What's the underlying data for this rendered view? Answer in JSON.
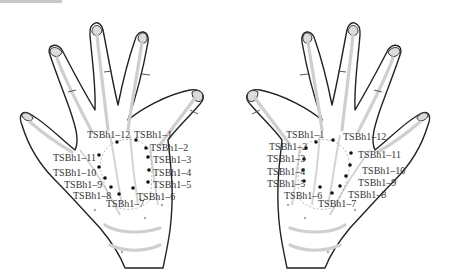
{
  "figure": {
    "left_hand": {
      "labels": [
        {
          "id": "TSBh1-1",
          "text": "TSBh1–1"
        },
        {
          "id": "TSBh1-2",
          "text": "TSBh1–2"
        },
        {
          "id": "TSBh1-3",
          "text": "TSBh1–3"
        },
        {
          "id": "TSBh1-4",
          "text": "TSBh1–4"
        },
        {
          "id": "TSBh1-5",
          "text": "TSBh1–5"
        },
        {
          "id": "TSBh1-6",
          "text": "TSBh1–6"
        },
        {
          "id": "TSBh1-7",
          "text": "TSBh1–7"
        },
        {
          "id": "TSBh1-8",
          "text": "TSBh1–8"
        },
        {
          "id": "TSBh1-9",
          "text": "TSBh1–9"
        },
        {
          "id": "TSBh1-10",
          "text": "TSBh1–10"
        },
        {
          "id": "TSBh1-11",
          "text": "TSBh1–11"
        },
        {
          "id": "TSBh1-12",
          "text": "TSBh1–12"
        }
      ]
    },
    "right_hand": {
      "labels": [
        {
          "id": "TSBh1-1",
          "text": "TSBh1–1"
        },
        {
          "id": "TSBh1-2",
          "text": "TSBh1–2"
        },
        {
          "id": "TSBh1-3",
          "text": "TSBh1–3"
        },
        {
          "id": "TSBh1-4",
          "text": "TSBh1–4"
        },
        {
          "id": "TSBh1-5",
          "text": "TSBh1–5"
        },
        {
          "id": "TSBh1-6",
          "text": "TSBh1–6"
        },
        {
          "id": "TSBh1-7",
          "text": "TSBh1–7"
        },
        {
          "id": "TSBh1-8",
          "text": "TSBh1–8"
        },
        {
          "id": "TSBh1-9",
          "text": "TSBh1–9"
        },
        {
          "id": "TSBh1-10",
          "text": "TSBh1–10"
        },
        {
          "id": "TSBh1-11",
          "text": "TSBh1–11"
        },
        {
          "id": "TSBh1-12",
          "text": "TSBh1–12"
        }
      ]
    },
    "colors": {
      "outline": "#222222",
      "bone": "#cfcfcf",
      "point": "#111111",
      "label": "#333333"
    }
  }
}
